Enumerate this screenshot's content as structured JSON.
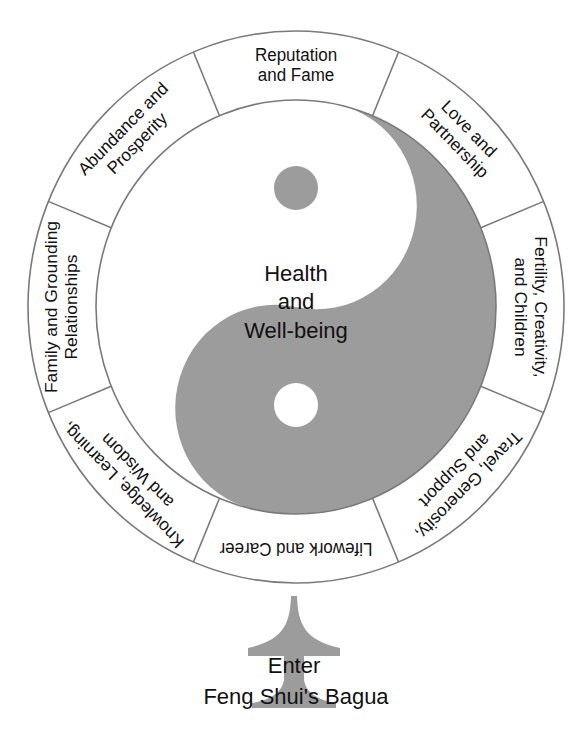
{
  "diagram": {
    "title": "Feng Shui's Bagua",
    "center": {
      "lines": [
        "Health",
        "and",
        "Well-being"
      ]
    },
    "segments": [
      {
        "id": "reputation",
        "angle": 0,
        "lines": [
          "Reputation",
          "and Fame"
        ]
      },
      {
        "id": "love",
        "angle": 45,
        "lines": [
          "Love and",
          "Partnership"
        ]
      },
      {
        "id": "fertility",
        "angle": 90,
        "lines": [
          "Fertility, Creativity,",
          "and Children"
        ]
      },
      {
        "id": "travel",
        "angle": 135,
        "lines": [
          "Travel, Generosity,",
          "and Support"
        ]
      },
      {
        "id": "lifework",
        "angle": 180,
        "lines": [
          "Lifework and Career"
        ]
      },
      {
        "id": "knowledge",
        "angle": 225,
        "lines": [
          "Knowledge, Learning,",
          "and Wisdom"
        ]
      },
      {
        "id": "family",
        "angle": 270,
        "lines": [
          "Family and Grounding",
          "Relationships"
        ]
      },
      {
        "id": "abundance",
        "angle": 315,
        "lines": [
          "Abundance and",
          "Prosperity"
        ]
      }
    ],
    "entrance": {
      "lines": [
        "Enter",
        "Feng Shui's Bagua"
      ]
    },
    "colors": {
      "yin_yang_dark": "#9c9c9c",
      "ring_stroke": "#7a7a7a",
      "text": "#111111",
      "background": "#ffffff"
    }
  }
}
